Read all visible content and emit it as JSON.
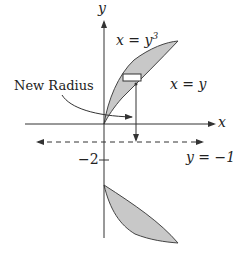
{
  "diagram": {
    "labels": {
      "y_axis": "y",
      "x_axis": "x",
      "curve_upper_left": "x = y",
      "curve_upper_left_exp": "3",
      "curve_right": "x = y",
      "new_radius": "New Radius",
      "tick_minus2": "−2",
      "axis_of_rotation": "y = −1"
    },
    "colors": {
      "region_fill": "#c8c8c8",
      "stroke": "#333333",
      "rect_fill": "#ffffff"
    }
  }
}
